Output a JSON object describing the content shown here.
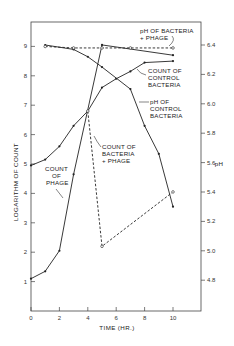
{
  "chart_data": {
    "type": "line",
    "title": "",
    "xlabel": "TIME (HR.)",
    "ylabel": "LOGARITHM OF COUNT",
    "y2label": "pH",
    "xlim": [
      0,
      12
    ],
    "ylim": [
      0,
      10
    ],
    "y2lim": [
      4.6,
      6.6
    ],
    "x_ticks": [
      0,
      2,
      4,
      6,
      8,
      10
    ],
    "x_tick_labels": [
      "0",
      "2",
      "4",
      "6",
      "8",
      "10"
    ],
    "y_ticks": [
      1,
      2,
      3,
      4,
      5,
      6,
      7,
      8,
      9
    ],
    "y_tick_labels": [
      "1",
      "2",
      "3",
      "4",
      "5",
      "6",
      "7",
      "8",
      "9"
    ],
    "y2_ticks": [
      4.8,
      5.0,
      5.2,
      5.4,
      5.6,
      5.8,
      6.0,
      6.2,
      6.4
    ],
    "y2_tick_labels": [
      "4.8",
      "5.0",
      "5.2",
      "5.4",
      "5.6",
      "5.8",
      "6.0",
      "6.2",
      "6.4"
    ],
    "grid": false,
    "series": [
      {
        "name": "COUNT OF CONTROL BACTERIA",
        "axis": "left",
        "style": "solid",
        "marker": "dot",
        "x": [
          0,
          1,
          2,
          3,
          4,
          5,
          6,
          7,
          8,
          10
        ],
        "values": [
          4.95,
          5.15,
          5.6,
          6.3,
          6.8,
          7.6,
          7.9,
          8.15,
          8.45,
          8.5
        ]
      },
      {
        "name": "COUNT OF PHAGE",
        "axis": "left",
        "style": "solid",
        "marker": "dot",
        "x": [
          0,
          1,
          2,
          3,
          5,
          10
        ],
        "values": [
          1.1,
          1.35,
          2.05,
          4.65,
          9.05,
          8.7
        ]
      },
      {
        "name": "COUNT OF BACTERIA + PHAGE",
        "axis": "left",
        "style": "dashed",
        "marker": "open-circle",
        "x": [
          4,
          5,
          10
        ],
        "values": [
          6.8,
          2.2,
          4.05
        ]
      },
      {
        "name": "pH OF CONTROL BACTERIA",
        "axis": "right",
        "style": "solid",
        "marker": "dot",
        "x": [
          1,
          3,
          4,
          5,
          7,
          8,
          9,
          10
        ],
        "values": [
          6.4,
          6.37,
          6.32,
          6.25,
          6.1,
          5.85,
          5.66,
          5.3
        ]
      },
      {
        "name": "pH OF BACTERIA + PHAGE",
        "axis": "right",
        "style": "dashed",
        "marker": "open-circle",
        "x": [
          1,
          3,
          5,
          7,
          10
        ],
        "values": [
          6.39,
          6.38,
          6.38,
          6.38,
          6.38
        ]
      }
    ],
    "annotations": [
      {
        "text_lines": [
          "pH OF BACTERIA",
          "+ PHAGE"
        ],
        "target": "pH OF BACTERIA + PHAGE"
      },
      {
        "text_lines": [
          "COUNT OF",
          "CONTROL",
          "BACTERIA"
        ],
        "target": "COUNT OF CONTROL BACTERIA"
      },
      {
        "text_lines": [
          "pH OF",
          "CONTROL",
          "BACTERIA"
        ],
        "target": "pH OF CONTROL BACTERIA"
      },
      {
        "text_lines": [
          "COUNT OF",
          "BACTERIA",
          "+ PHAGE"
        ],
        "target": "COUNT OF BACTERIA + PHAGE"
      },
      {
        "text_lines": [
          "COUNT",
          "OF",
          "PHAGE"
        ],
        "target": "COUNT OF PHAGE"
      }
    ],
    "legend": "none (inline annotations)"
  },
  "labels": {
    "xlabel": "TIME (HR.)",
    "ylabel": "LOGARITHM OF COUNT",
    "y2label": "pH",
    "anno_ph_phage_1": "pH OF BACTERIA",
    "anno_ph_phage_2": "+ PHAGE",
    "anno_count_control_1": "COUNT OF",
    "anno_count_control_2": "CONTROL",
    "anno_count_control_3": "BACTERIA",
    "anno_ph_control_1": "pH OF",
    "anno_ph_control_2": "CONTROL",
    "anno_ph_control_3": "BACTERIA",
    "anno_count_bp_1": "COUNT OF",
    "anno_count_bp_2": "BACTERIA",
    "anno_count_bp_3": "+ PHAGE",
    "anno_phage_1": "COUNT",
    "anno_phage_2": "OF",
    "anno_phage_3": "PHAGE"
  }
}
